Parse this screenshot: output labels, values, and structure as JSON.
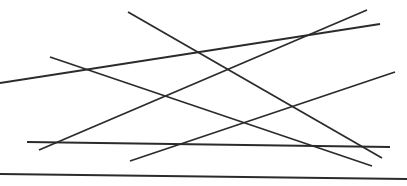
{
  "figure": {
    "kind": "line-drawing",
    "width": 407,
    "height": 186,
    "background_color": "#ffffff",
    "stroke_color": "#2b2b2b",
    "stroke_width": 1.8,
    "segment_count": 7,
    "has_text": false,
    "has_axes": false,
    "has_legend": false
  },
  "chart_data": {
    "type": "line",
    "title": "",
    "subtitle": "",
    "xlabel": "",
    "ylabel": "",
    "xlim": [
      0,
      407
    ],
    "ylim": [
      186,
      0
    ],
    "grid": false,
    "legend": "none",
    "note": "Pixel coordinates: origin at top-left, y increases downward.",
    "series": [
      {
        "name": "segment-1-descending-steep",
        "color": "#2b2b2b",
        "width": 1.8,
        "x": [
          128,
          382
        ],
        "y": [
          12,
          158
        ],
        "values": [
          [
            128,
            12
          ],
          [
            382,
            158
          ]
        ]
      },
      {
        "name": "segment-2-descending-shallow",
        "color": "#2b2b2b",
        "width": 1.8,
        "x": [
          50,
          372
        ],
        "y": [
          57,
          166
        ],
        "values": [
          [
            50,
            57
          ],
          [
            372,
            166
          ]
        ]
      },
      {
        "name": "segment-3-ascending-shallow-to-top-right",
        "color": "#2b2b2b",
        "width": 1.8,
        "x": [
          0,
          380
        ],
        "y": [
          83,
          24
        ],
        "values": [
          [
            0,
            83
          ],
          [
            380,
            24
          ]
        ]
      },
      {
        "name": "segment-4-ascending-steep-to-top-right",
        "color": "#2b2b2b",
        "width": 1.8,
        "x": [
          39,
          367
        ],
        "y": [
          150,
          10
        ],
        "values": [
          [
            39,
            150
          ],
          [
            367,
            10
          ]
        ]
      },
      {
        "name": "segment-5-ascending-to-middle-right",
        "color": "#2b2b2b",
        "width": 1.8,
        "x": [
          130,
          395
        ],
        "y": [
          161,
          72
        ],
        "values": [
          [
            130,
            161
          ],
          [
            395,
            72
          ]
        ]
      },
      {
        "name": "segment-6-near-horizontal-lower",
        "color": "#2b2b2b",
        "width": 1.8,
        "x": [
          27,
          390
        ],
        "y": [
          142,
          147
        ],
        "values": [
          [
            27,
            142
          ],
          [
            390,
            147
          ]
        ]
      },
      {
        "name": "segment-7-bottom-rule",
        "color": "#2b2b2b",
        "width": 2.0,
        "x": [
          0,
          407
        ],
        "y": [
          174,
          179
        ],
        "values": [
          [
            0,
            174
          ],
          [
            407,
            179
          ]
        ]
      }
    ]
  }
}
